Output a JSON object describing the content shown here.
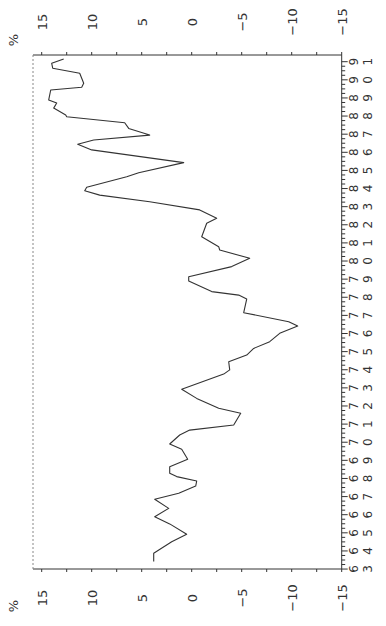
{
  "chart_data": {
    "type": "line",
    "title": "",
    "orientation": "rotated 90 degrees clockwise (x axis runs vertically on right, y axis runs horizontally along top and bottom)",
    "xlabel": "",
    "ylabel": "%",
    "xlim": [
      63,
      91
    ],
    "ylim": [
      -15,
      15
    ],
    "x_tick_labels": [
      "63",
      "64",
      "65",
      "66",
      "67",
      "68",
      "69",
      "70",
      "71",
      "72",
      "73",
      "74",
      "75",
      "76",
      "77",
      "78",
      "79",
      "80",
      "81",
      "82",
      "83",
      "84",
      "85",
      "86",
      "87",
      "88",
      "89",
      "90",
      "91"
    ],
    "y_ticks": [
      15,
      10,
      5,
      0,
      -5,
      -10,
      -15
    ],
    "y_tick_labels": [
      "15",
      "10",
      "5",
      "0",
      "−5",
      "−10",
      "−15"
    ],
    "grid": false,
    "legend": null,
    "series": [
      {
        "name": "%",
        "color": "#333333",
        "x": [
          63.41,
          63.87,
          64.51,
          64.92,
          65.49,
          65.89,
          66.35,
          66.85,
          67.18,
          67.58,
          67.86,
          68.1,
          68.29,
          68.65,
          69.06,
          69.61,
          69.9,
          70.4,
          70.67,
          70.95,
          71.6,
          71.87,
          72.42,
          72.92,
          73.76,
          73.99,
          74.44,
          74.81,
          75.18,
          75.55,
          76.01,
          76.41,
          76.65,
          77.15,
          77.9,
          78.12,
          78.31,
          78.9,
          79.13,
          79.69,
          80.15,
          80.61,
          80.79,
          81.34,
          82.08,
          82.36,
          82.82,
          83.27,
          83.64,
          83.88,
          84.07,
          84.65,
          84.87,
          85.43,
          86.13,
          86.44,
          86.68,
          86.95,
          87.32,
          87.63,
          87.96,
          88.06,
          88.44,
          88.72,
          88.89,
          89.44,
          89.59,
          89.81,
          90.36,
          90.64,
          90.91,
          91.15
        ],
        "values": [
          3.8,
          3.8,
          2.0,
          0.5,
          2.2,
          3.7,
          2.3,
          3.7,
          1.3,
          -0.4,
          -0.5,
          1.5,
          2.2,
          2.2,
          0.4,
          1.0,
          2.2,
          1.2,
          0.2,
          -4.2,
          -4.9,
          -2.7,
          -0.5,
          1.0,
          -3.2,
          -3.8,
          -3.7,
          -5.5,
          -6.2,
          -7.8,
          -8.8,
          -10.6,
          -9.7,
          -5.2,
          -5.5,
          -4.7,
          -2.0,
          0.3,
          0.3,
          -4.0,
          -5.8,
          -2.8,
          -2.7,
          -1.0,
          -1.5,
          -2.5,
          -0.8,
          4.2,
          9.2,
          10.7,
          10.5,
          6.5,
          5.3,
          0.8,
          10.0,
          11.4,
          9.8,
          4.2,
          6.3,
          6.7,
          12.5,
          12.6,
          13.8,
          13.5,
          14.3,
          14.1,
          11.0,
          10.8,
          11.2,
          13.9,
          14.0,
          12.8
        ]
      }
    ]
  },
  "layout": {
    "plot_left": 33,
    "plot_right": 341.7,
    "plot_top": 55,
    "plot_bottom": 569,
    "value_zero_x": 191.7,
    "px_per_value": 10,
    "year_top": 91,
    "year_top_y": 61.7,
    "px_per_year": 18.12,
    "top_label_y": 22,
    "bottom_label_y": 598,
    "percent_label_top": {
      "x": 18,
      "y": 40
    },
    "percent_label_bottom": {
      "x": 18,
      "y": 606
    },
    "frame_color": "#333333"
  }
}
